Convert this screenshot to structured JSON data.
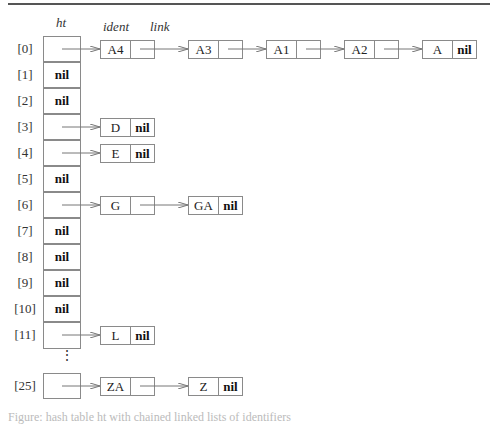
{
  "headers": {
    "table": "ht",
    "ident": "ident",
    "link": "link"
  },
  "nil_label": "nil",
  "rows": [
    {
      "index": "[0]",
      "value": "",
      "chain": [
        "A4",
        "A3",
        "A1",
        "A2",
        "A"
      ]
    },
    {
      "index": "[1]",
      "value": "nil",
      "chain": []
    },
    {
      "index": "[2]",
      "value": "nil",
      "chain": []
    },
    {
      "index": "[3]",
      "value": "",
      "chain": [
        "D"
      ]
    },
    {
      "index": "[4]",
      "value": "",
      "chain": [
        "E"
      ]
    },
    {
      "index": "[5]",
      "value": "nil",
      "chain": []
    },
    {
      "index": "[6]",
      "value": "",
      "chain": [
        "G",
        "GA"
      ]
    },
    {
      "index": "[7]",
      "value": "nil",
      "chain": []
    },
    {
      "index": "[8]",
      "value": "nil",
      "chain": []
    },
    {
      "index": "[9]",
      "value": "nil",
      "chain": []
    },
    {
      "index": "[10]",
      "value": "nil",
      "chain": []
    },
    {
      "index": "[11]",
      "value": "",
      "chain": [
        "L"
      ]
    },
    {
      "index": "[25]",
      "value": "",
      "chain": [
        "ZA",
        "Z"
      ]
    }
  ],
  "ellipsis": "⋮",
  "caption": "Figure: hash table ht with chained linked lists of identifiers"
}
